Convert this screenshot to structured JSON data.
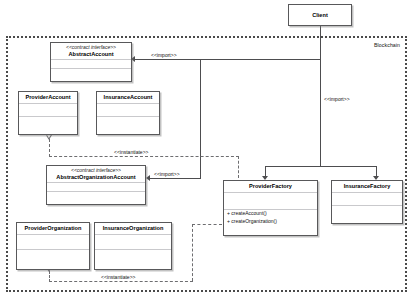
{
  "diagram": {
    "type": "uml-class-diagram",
    "boundary": {
      "label": "Blockchain"
    },
    "classes": [
      {
        "id": "client",
        "name": "Client",
        "stereotype": "",
        "compartments": 0,
        "members": []
      },
      {
        "id": "abstract-account",
        "name": "AbstractAccount",
        "stereotype": "<<contract interface>>",
        "compartments": 2,
        "members": []
      },
      {
        "id": "provider-account",
        "name": "ProviderAccount",
        "stereotype": "",
        "compartments": 2,
        "members": []
      },
      {
        "id": "insurance-account",
        "name": "InsuranceAccount",
        "stereotype": "",
        "compartments": 2,
        "members": []
      },
      {
        "id": "abstract-organization-account",
        "name": "AbstractOrganizationAccount",
        "stereotype": "<<contract interface>>",
        "compartments": 2,
        "members": []
      },
      {
        "id": "provider-organization",
        "name": "ProviderOrganization",
        "stereotype": "",
        "compartments": 2,
        "members": []
      },
      {
        "id": "insurance-organization",
        "name": "InsuranceOrganization",
        "stereotype": "",
        "compartments": 2,
        "members": []
      },
      {
        "id": "provider-factory",
        "name": "ProviderFactory",
        "stereotype": "",
        "compartments": 2,
        "members": [
          "+ createAccount()",
          "+ createOrganization()"
        ]
      },
      {
        "id": "insurance-factory",
        "name": "InsuranceFactory",
        "stereotype": "",
        "compartments": 2,
        "members": []
      }
    ],
    "connectors": [
      {
        "id": "import-abstract-account",
        "label": "<<import>>",
        "kind": "import"
      },
      {
        "id": "import-client-factories",
        "label": "<<import>>",
        "kind": "import"
      },
      {
        "id": "import-abstract-organization-account",
        "label": "<<import>>",
        "kind": "import"
      },
      {
        "id": "instantiate-provider-account",
        "label": "<<instantiate>>",
        "kind": "instantiate"
      },
      {
        "id": "instantiate-provider-organization",
        "label": "<<instantiate>>",
        "kind": "instantiate"
      }
    ]
  }
}
